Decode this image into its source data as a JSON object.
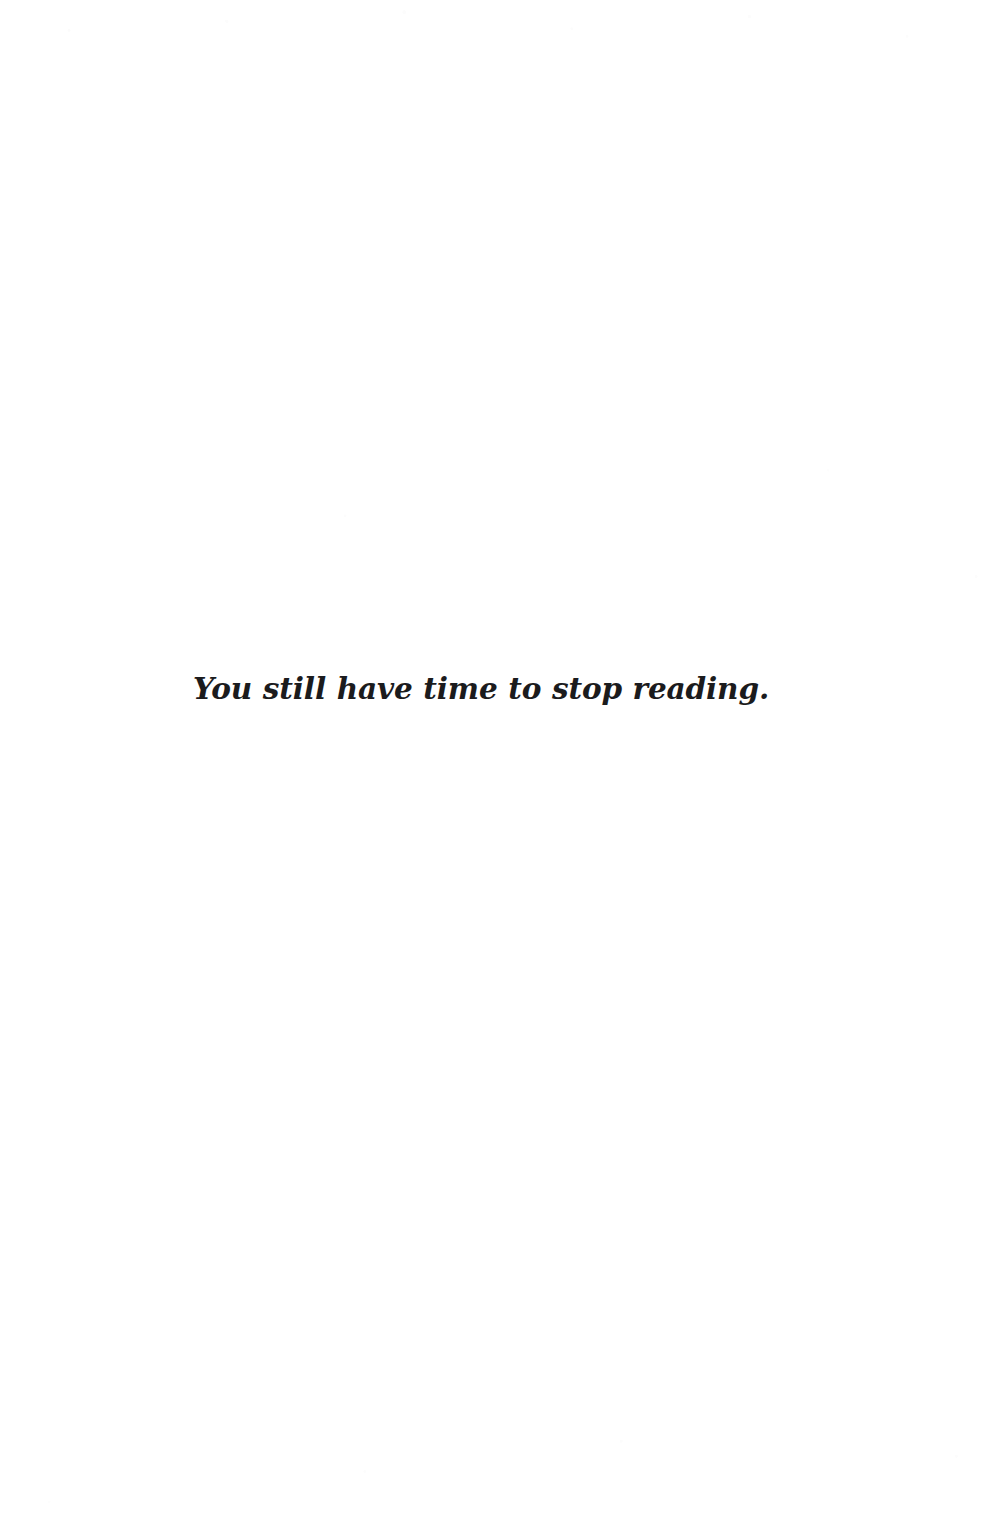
{
  "page": {
    "kind": "printed-book-page",
    "background_color": "#ffffff",
    "ink_color": "#1b1b1d",
    "header": "",
    "footer": "",
    "page_number": "",
    "running_head": ""
  },
  "epigraph": {
    "text": "You still have time to stop reading.",
    "alignment": "center",
    "style": "bold-italic-slab-serif"
  }
}
